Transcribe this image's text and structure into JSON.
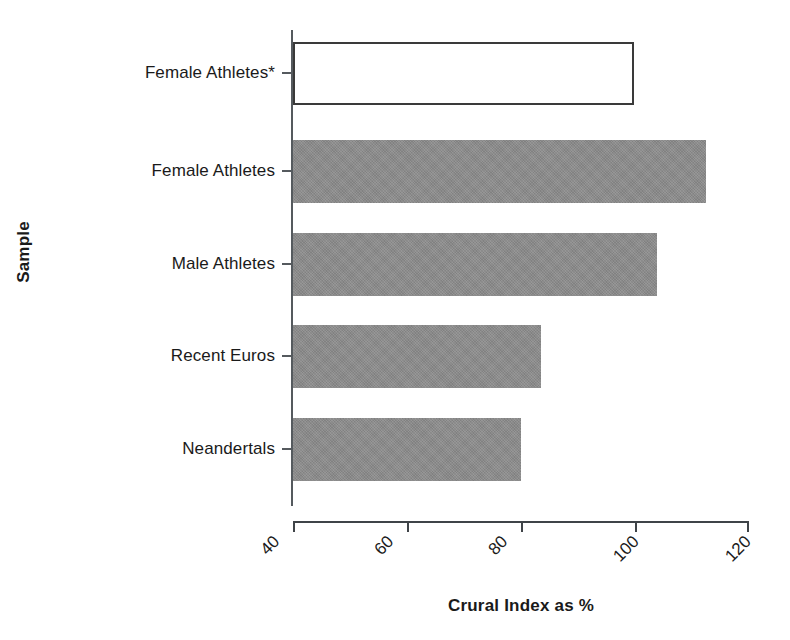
{
  "chart_data": {
    "type": "bar",
    "orientation": "horizontal",
    "title": "",
    "xlabel": "Crural Index as %",
    "ylabel": "Sample",
    "categories": [
      "Female Athletes*",
      "Female Athletes",
      "Male Athletes",
      "Recent Euros",
      "Neandertals"
    ],
    "values": [
      100,
      112.6,
      104,
      83.6,
      80
    ],
    "bar_styles": [
      "outline",
      "filled",
      "filled",
      "filled",
      "filled"
    ],
    "xlim": [
      40,
      120
    ],
    "xticks": [
      40,
      60,
      80,
      100,
      120
    ],
    "xtick_labels": [
      "40",
      "60",
      "80",
      "100",
      "120"
    ],
    "xtick_rotation_deg": -45,
    "grid": false,
    "legend": "none",
    "colors": {
      "bar_fill": "#8c8c8c",
      "bar_outline_stroke": "#3a3a3a",
      "axis": "#3f4448",
      "text": "#1a1a1a",
      "background": "#ffffff"
    }
  },
  "axes": {
    "y_title": "Sample",
    "x_title": "Crural Index as %"
  }
}
